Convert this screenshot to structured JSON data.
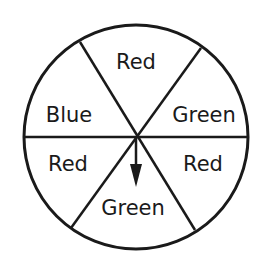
{
  "diagram": {
    "type": "spinner",
    "sectors": [
      {
        "label": "Red",
        "position": "top"
      },
      {
        "label": "Green",
        "position": "upper-right"
      },
      {
        "label": "Red",
        "position": "lower-right"
      },
      {
        "label": "Green",
        "position": "bottom"
      },
      {
        "label": "Red",
        "position": "lower-left"
      },
      {
        "label": "Blue",
        "position": "upper-left"
      }
    ],
    "pointer": {
      "direction": "down",
      "points_to": "Green"
    },
    "colors": {
      "stroke": "#1a1a1a",
      "background": "#ffffff"
    }
  }
}
